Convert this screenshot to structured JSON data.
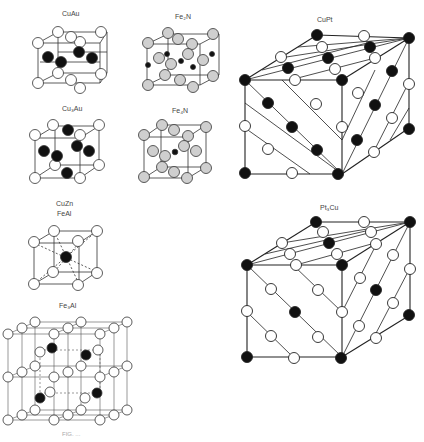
{
  "figure": {
    "structures": [
      {
        "id": "cuau",
        "label": "CuAu"
      },
      {
        "id": "fe2n",
        "label": "Fe₂N"
      },
      {
        "id": "cu3au",
        "label": "Cu₃Au"
      },
      {
        "id": "fe4n",
        "label": "Fe₄N"
      },
      {
        "id": "cuzn",
        "label": "CuZn",
        "label2": "FeAl"
      },
      {
        "id": "fe3al",
        "label": "Fe₃Al"
      },
      {
        "id": "cupt",
        "label": "CuPt"
      },
      {
        "id": "pt3cu",
        "label": "Pt₃Cu"
      }
    ],
    "legend": {
      "open_atom": "white circle",
      "filled_atom": "black circle",
      "gray_atom": "gray circle"
    },
    "colors": {
      "line": "#333333",
      "filled": "#111111",
      "gray": "#cfcfcf",
      "open": "#ffffff"
    },
    "caption": "FIG. ..."
  }
}
